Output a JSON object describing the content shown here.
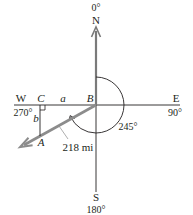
{
  "diagram": {
    "type": "compass bearing diagram",
    "directions": {
      "north": {
        "letter": "N",
        "degrees": "0°"
      },
      "east": {
        "letter": "E",
        "degrees": "90°"
      },
      "south": {
        "letter": "S",
        "degrees": "180°"
      },
      "west": {
        "letter": "W",
        "degrees": "270°"
      }
    },
    "points": {
      "A": "A",
      "B": "B",
      "C": "C"
    },
    "sides": {
      "a": "a",
      "b": "b"
    },
    "distance_label": "218 mi",
    "bearing_label": "245°",
    "colors": {
      "axis": "#231f20",
      "north_arrow": "#7a7a7a",
      "path_arrow": "#8c8c8c",
      "arc": "#231f20"
    }
  }
}
